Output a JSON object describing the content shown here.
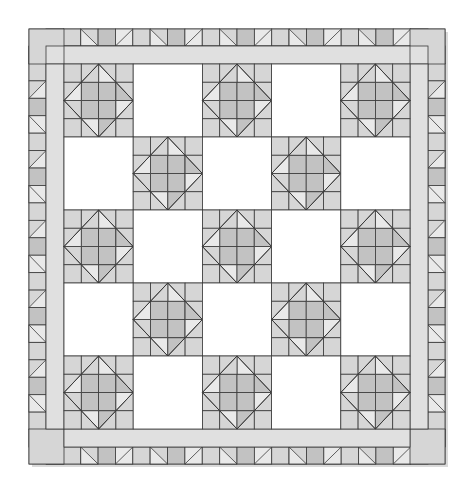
{
  "quilt": {
    "outer": {
      "x": 29,
      "y": 29,
      "w": 416,
      "h": 435
    },
    "border_width": 17,
    "sashing_width": 18,
    "block_grid": {
      "rows": 5,
      "cols": 5,
      "origin_x": 64,
      "origin_y": 65,
      "block_w": 69.4,
      "block_h": 69.4
    },
    "pattern": [
      [
        "pieced",
        "plain",
        "pieced",
        "plain",
        "pieced"
      ],
      [
        "plain",
        "pieced",
        "plain",
        "pieced",
        "plain"
      ],
      [
        "pieced",
        "plain",
        "pieced",
        "plain",
        "pieced"
      ],
      [
        "plain",
        "pieced",
        "plain",
        "pieced",
        "plain"
      ],
      [
        "pieced",
        "plain",
        "pieced",
        "plain",
        "pieced"
      ]
    ],
    "block_name": "Diamond-in-a-square 4x4 pieced block"
  },
  "colors": {
    "background": "#ffffff",
    "line": "#3a3a3a",
    "light": "#e9e9e9",
    "medium": "#d6d6d6",
    "dark": "#c2c2c2",
    "sashing": "#e0e0e0",
    "plain": "#ffffff",
    "shadow": "#b5b5b5"
  }
}
